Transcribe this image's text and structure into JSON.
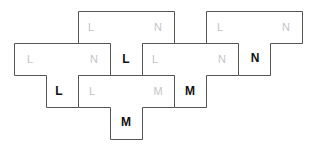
{
  "diagram": {
    "type": "tetromino-tiling",
    "cell_size": 32,
    "pieces": [
      {
        "id": "A",
        "shape": "T",
        "path": "M78.5,11.5 H174.5 V43.5 H142.5 V75.5 H110.5 V43.5 H78.5 Z",
        "labels": [
          {
            "text": "L",
            "x": 91,
            "y": 27,
            "style": "faint"
          },
          {
            "text": "N",
            "x": 158,
            "y": 27,
            "style": "faint"
          },
          {
            "text": "L",
            "x": 126,
            "y": 59,
            "style": "bold"
          }
        ]
      },
      {
        "id": "B",
        "shape": "T",
        "path": "M14.5,43.5 H110.5 V75.5 H78.5 V107.5 H46.5 V75.5 H14.5 Z",
        "labels": [
          {
            "text": "L",
            "x": 30,
            "y": 59,
            "style": "faint"
          },
          {
            "text": "N",
            "x": 94,
            "y": 59,
            "style": "faint"
          },
          {
            "text": "L",
            "x": 59,
            "y": 91,
            "style": "bold"
          }
        ]
      },
      {
        "id": "C",
        "shape": "T",
        "path": "M206.5,11.5 H302.5 V43.5 H270.5 V75.5 H238.5 V43.5 H206.5 Z",
        "labels": [
          {
            "text": "L",
            "x": 220,
            "y": 27,
            "style": "faint"
          },
          {
            "text": "N",
            "x": 286,
            "y": 27,
            "style": "faint"
          },
          {
            "text": "N",
            "x": 255,
            "y": 58,
            "style": "bold"
          }
        ]
      },
      {
        "id": "D",
        "shape": "T",
        "path": "M142.5,43.5 H238.5 V75.5 H206.5 V107.5 H174.5 V75.5 H142.5 Z",
        "labels": [
          {
            "text": "L",
            "x": 155,
            "y": 59,
            "style": "faint"
          },
          {
            "text": "N",
            "x": 222,
            "y": 59,
            "style": "faint"
          },
          {
            "text": "M",
            "x": 190,
            "y": 91,
            "style": "bold"
          }
        ]
      },
      {
        "id": "E",
        "shape": "T",
        "path": "M78.5,75.5 H174.5 V107.5 H142.5 V139.5 H110.5 V107.5 H78.5 Z",
        "labels": [
          {
            "text": "L",
            "x": 92,
            "y": 91,
            "style": "faint"
          },
          {
            "text": "M",
            "x": 158,
            "y": 91,
            "style": "faint"
          },
          {
            "text": "M",
            "x": 126,
            "y": 122,
            "style": "bold"
          }
        ]
      }
    ]
  },
  "colors": {
    "background": "#ffffff",
    "outline": "#555555",
    "faint_label": "#c4c4c4",
    "bold_label": "#111111"
  }
}
